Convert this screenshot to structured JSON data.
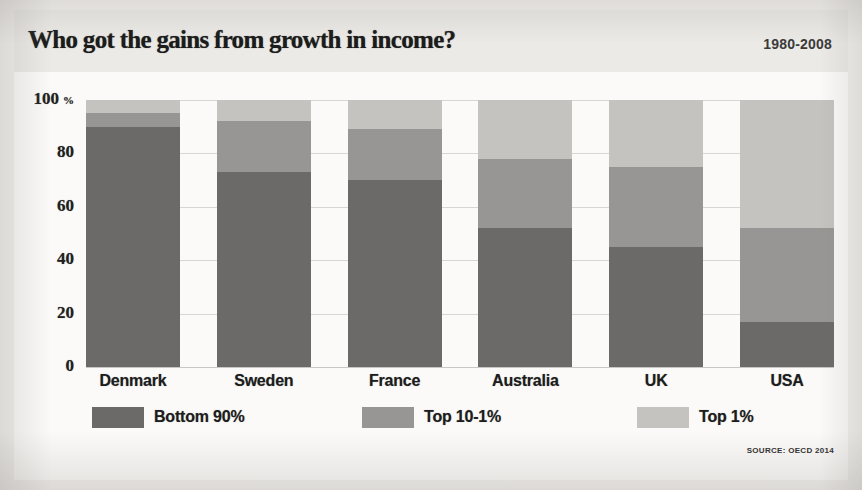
{
  "header": {
    "title": "Who got the gains from growth in income?",
    "period": "1980-2008"
  },
  "source": {
    "note": "SOURCE: OECD 2014"
  },
  "colors": {
    "bottom90": "#6c6a68",
    "top10_1": "#989694",
    "top1": "#c5c3c0",
    "panel_bg": "#fbfaf8",
    "header_bg": "#eceae7",
    "gridline": "#d8d6d3",
    "text": "#1d1d1d"
  },
  "chart_data": {
    "type": "bar",
    "title": "Who got the gains from growth in income?",
    "subtitle": "1980-2008",
    "xlabel": "",
    "ylabel": "%",
    "ylim": [
      0,
      100
    ],
    "yticks": [
      0,
      20,
      40,
      60,
      80,
      100
    ],
    "ytick_labels": [
      "0",
      "20",
      "40",
      "60",
      "80",
      "100"
    ],
    "ytick_unit": "%",
    "grid": true,
    "stacked": true,
    "legend_position": "bottom",
    "categories": [
      "Denmark",
      "Sweden",
      "France",
      "Australia",
      "UK",
      "USA"
    ],
    "series": [
      {
        "name": "Bottom 90%",
        "color": "#6c6a68",
        "values": [
          90,
          73,
          70,
          52,
          45,
          17
        ]
      },
      {
        "name": "Top 10-1%",
        "color": "#989694",
        "values": [
          5,
          19,
          19,
          26,
          30,
          35
        ]
      },
      {
        "name": "Top 1%",
        "color": "#c5c3c0",
        "values": [
          5,
          8,
          11,
          22,
          25,
          48
        ]
      }
    ],
    "annotations": [
      "SOURCE: OECD 2014"
    ]
  },
  "yaxis": {
    "ticks": [
      {
        "label": "100",
        "value": 100,
        "unit": "%"
      },
      {
        "label": "80",
        "value": 80,
        "unit": ""
      },
      {
        "label": "60",
        "value": 60,
        "unit": ""
      },
      {
        "label": "40",
        "value": 40,
        "unit": ""
      },
      {
        "label": "20",
        "value": 20,
        "unit": ""
      },
      {
        "label": "0",
        "value": 0,
        "unit": ""
      }
    ]
  }
}
